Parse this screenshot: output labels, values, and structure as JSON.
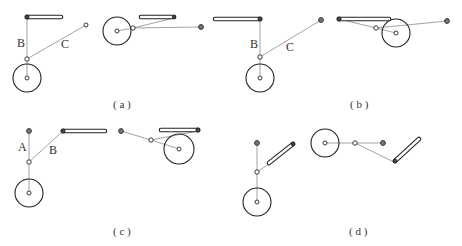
{
  "figure": {
    "panels": [
      {
        "id": "a",
        "caption": "( a )",
        "labels": {
          "B": "B",
          "C": "C"
        }
      },
      {
        "id": "b",
        "caption": "( b )",
        "labels": {
          "B": "B",
          "C": "C"
        }
      },
      {
        "id": "c",
        "caption": "( c )",
        "labels": {
          "A": "A",
          "B": "B"
        }
      },
      {
        "id": "d",
        "caption": "( d )",
        "labels": {}
      }
    ]
  },
  "colors": {
    "line": "#8a8a8a",
    "stroke": "#222222",
    "anchor_fill": "#777777",
    "background": "#ffffff"
  }
}
